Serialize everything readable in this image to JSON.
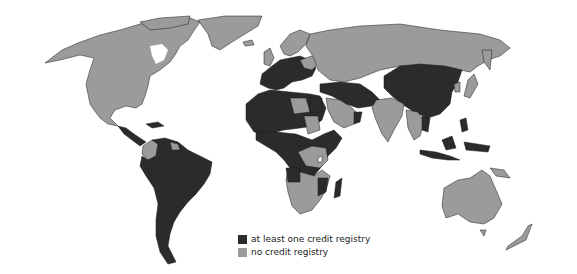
{
  "map": {
    "title": "",
    "colors": {
      "registry": "#2b2b2b",
      "none": "#9b9b9b",
      "border": "#1a1a1a",
      "ocean": "#ffffff"
    }
  },
  "legend": {
    "items": [
      {
        "label": "at least one credit registry",
        "color": "#2b2b2b"
      },
      {
        "label": "no credit registry",
        "color": "#9b9b9b"
      }
    ]
  }
}
